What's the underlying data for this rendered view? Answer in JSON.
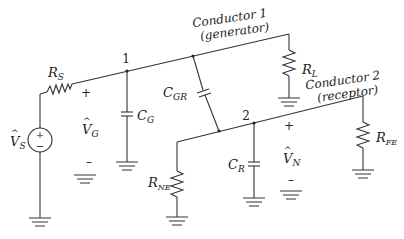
{
  "diagram": {
    "type": "circuit-schematic",
    "conductors": {
      "generator": {
        "title": "Conductor 1",
        "subtitle": "(generator)"
      },
      "receptor": {
        "title": "Conductor 2",
        "subtitle": "(receptor)"
      }
    },
    "nodes": {
      "node1": "1",
      "node2": "2"
    },
    "components": {
      "source": {
        "symbol": "V",
        "sub": "S",
        "plus": "+",
        "minus": "−"
      },
      "rs": {
        "symbol": "R",
        "sub": "S"
      },
      "rl": {
        "symbol": "R",
        "sub": "L"
      },
      "cg": {
        "symbol": "C",
        "sub": "G"
      },
      "cgr": {
        "symbol": "C",
        "sub": "GR"
      },
      "cr": {
        "symbol": "C",
        "sub": "R"
      },
      "rne": {
        "symbol": "R",
        "sub": "NE"
      },
      "rfe": {
        "symbol": "R",
        "sub": "FE"
      }
    },
    "voltages": {
      "vg": {
        "symbol": "V",
        "sub": "G",
        "plus": "+",
        "minus": "–"
      },
      "vn": {
        "symbol": "V",
        "sub": "N",
        "plus": "+",
        "minus": "–"
      }
    },
    "hat": "^"
  }
}
